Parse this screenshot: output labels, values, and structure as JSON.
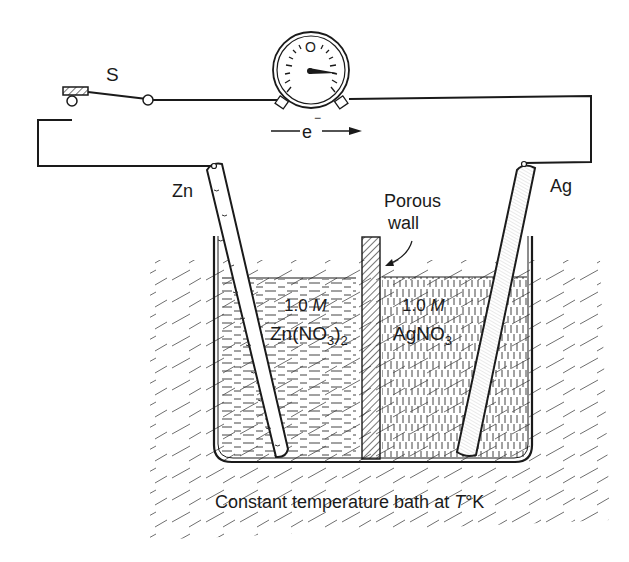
{
  "diagram": {
    "labels": {
      "switch": "S",
      "electron": "e",
      "electron_sup": "−",
      "zn_electrode": "Zn",
      "ag_electrode": "Ag",
      "porous_wall_line1": "Porous",
      "porous_wall_line2": "wall",
      "left_conc": "1.0",
      "left_conc_unit": "M",
      "left_solution_pre": "Zn(NO",
      "left_solution_sub3": "3",
      "left_solution_paren": ")",
      "left_solution_sub2": "2",
      "right_conc": "1.0",
      "right_conc_unit": "M",
      "right_solution_pre": "AgNO",
      "right_solution_sub3": "3",
      "bath_caption_pre": "Constant temperature bath at ",
      "bath_caption_T": "T",
      "bath_caption_post": "°K",
      "meter_zero": "O"
    },
    "components": [
      {
        "name": "switch",
        "label": "S",
        "state": "open"
      },
      {
        "name": "galvanometer",
        "needle": "deflected right"
      },
      {
        "name": "zinc-electrode",
        "label": "Zn",
        "solution": "1.0 M Zn(NO3)2"
      },
      {
        "name": "silver-electrode",
        "label": "Ag",
        "solution": "1.0 M AgNO3"
      },
      {
        "name": "porous-wall",
        "label": "Porous wall"
      },
      {
        "name": "temperature-bath",
        "label": "Constant temperature bath at T°K"
      }
    ],
    "electron_flow": "left-to-right",
    "colors": {
      "ink": "#1a1a1a",
      "background": "#ffffff"
    }
  }
}
